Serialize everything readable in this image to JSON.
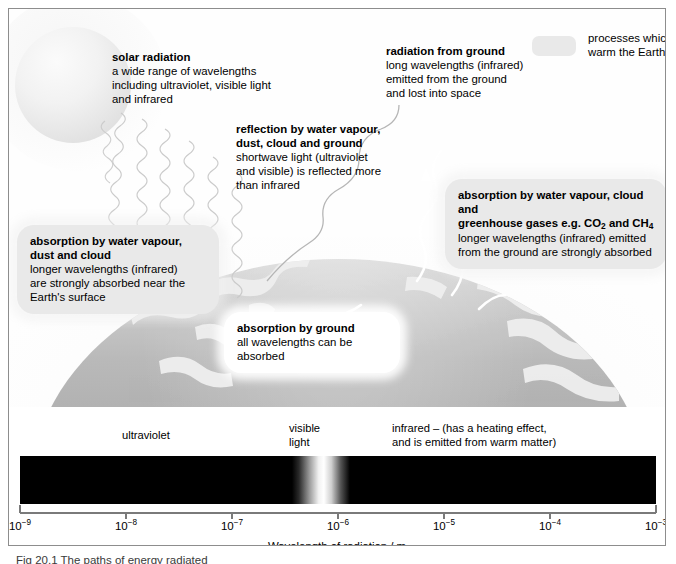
{
  "figure": {
    "caption": "Fig 20.1  The paths of energy radiated",
    "axis_title": "Wavelength of radiation / m"
  },
  "legend": {
    "swatch_color": "#e9e9e9",
    "text_line1": "processes which",
    "text_line2": "warm the Earth"
  },
  "annotations": {
    "solar": {
      "heading": "solar radiation",
      "lines": [
        "a wide range of wavelengths",
        "including ultraviolet, visible light",
        "and infrared"
      ]
    },
    "reflection": {
      "heading_line1": "reflection by water vapour,",
      "heading_line2": "dust, cloud and ground",
      "lines": [
        "shortwave light (ultraviolet",
        "and visible) is reflected more",
        "than infrared"
      ]
    },
    "radiation_from_ground": {
      "heading": "radiation from ground",
      "lines": [
        "long wavelengths (infrared)",
        "emitted from the ground",
        "and lost into space"
      ]
    },
    "absorption_water_dust_cloud": {
      "heading_line1": "absorption by water vapour,",
      "heading_line2": "dust and cloud",
      "lines": [
        "longer wavelengths (infrared)",
        "are strongly absorbed near the",
        "Earth's surface"
      ]
    },
    "absorption_greenhouse": {
      "heading_line1": "absorption by water vapour, cloud and",
      "heading_line2_pre": "greenhouse gases e.g. CO",
      "heading_line2_sub1": "2",
      "heading_line2_mid": " and CH",
      "heading_line2_sub2": "4",
      "lines": [
        "longer wavelengths (infrared) emitted",
        "from the ground are strongly absorbed"
      ]
    },
    "absorption_by_ground": {
      "heading": "absorption by ground",
      "lines": [
        "all wavelengths can be",
        "absorbed"
      ]
    }
  },
  "spectrum": {
    "bands": [
      {
        "name": "ultraviolet",
        "label": "ultraviolet"
      },
      {
        "name": "visible-light",
        "label_line1": "visible",
        "label_line2": "light"
      },
      {
        "name": "infrared",
        "label_line1": "infrared – (has a heating effect,",
        "label_line2": "and is emitted from warm matter)"
      }
    ],
    "bar_color": "#000000",
    "visible_band_color": "#ffffff"
  },
  "chart_data": {
    "type": "bar",
    "xlabel": "Wavelength of radiation / m",
    "ylabel": "",
    "xscale": "log",
    "xlim": [
      1e-09,
      0.001
    ],
    "grid": false,
    "legend_position": "top-right",
    "tick_labels": [
      "10⁻⁹",
      "10⁻⁸",
      "10⁻⁷",
      "10⁻⁶",
      "10⁻⁵",
      "10⁻⁴",
      "10⁻³"
    ],
    "tick_exponents": [
      -9,
      -8,
      -7,
      -6,
      -5,
      -4,
      -3
    ],
    "regions": [
      {
        "name": "ultraviolet",
        "from": 1e-09,
        "to": 4e-07,
        "shade": "black"
      },
      {
        "name": "visible light",
        "from": 4e-07,
        "to": 7e-07,
        "shade": "white"
      },
      {
        "name": "infrared",
        "from": 7e-07,
        "to": 0.001,
        "shade": "black"
      }
    ]
  },
  "ticks": [
    {
      "base": "10",
      "exp": "−9",
      "pct": 0
    },
    {
      "base": "10",
      "exp": "−8",
      "pct": 16.6667
    },
    {
      "base": "10",
      "exp": "−7",
      "pct": 33.3333
    },
    {
      "base": "10",
      "exp": "−6",
      "pct": 50
    },
    {
      "base": "10",
      "exp": "−5",
      "pct": 66.6667
    },
    {
      "base": "10",
      "exp": "−4",
      "pct": 83.3333
    },
    {
      "base": "10",
      "exp": "−3",
      "pct": 100
    }
  ]
}
